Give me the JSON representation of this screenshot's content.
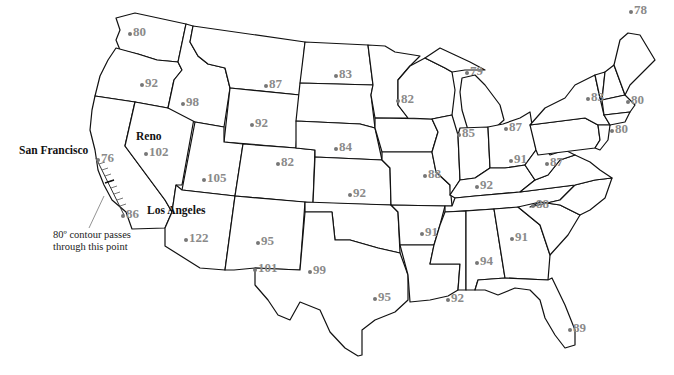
{
  "map": {
    "title": "",
    "units_hint": "temperature (°F)",
    "colors": {
      "state_fill": "#ffffff",
      "state_stroke": "#111111",
      "temperature_label": "#8a8a8a",
      "city_label": "#111111"
    }
  },
  "cities": [
    {
      "name": "San Francisco",
      "x": 19,
      "y": 145
    },
    {
      "name": "Reno",
      "x": 136,
      "y": 131
    },
    {
      "name": "Los Angeles",
      "x": 147,
      "y": 205
    }
  ],
  "annotation": {
    "line1": "80º contour passes",
    "line2": "through this point"
  },
  "temperatures": [
    {
      "value": "80",
      "x": 128,
      "y": 25,
      "region": "washington"
    },
    {
      "value": "92",
      "x": 140,
      "y": 76,
      "region": "oregon"
    },
    {
      "value": "98",
      "x": 181,
      "y": 95,
      "region": "idaho"
    },
    {
      "value": "87",
      "x": 264,
      "y": 77,
      "region": "montana"
    },
    {
      "value": "83",
      "x": 334,
      "y": 67,
      "region": "north-dakota"
    },
    {
      "value": "79",
      "x": 465,
      "y": 64,
      "region": "michigan-upper"
    },
    {
      "value": "78",
      "x": 629,
      "y": 3,
      "region": "maine"
    },
    {
      "value": "82",
      "x": 396,
      "y": 92,
      "region": "minnesota-wisconsin"
    },
    {
      "value": "83",
      "x": 586,
      "y": 90,
      "region": "new-york"
    },
    {
      "value": "80",
      "x": 626,
      "y": 93,
      "region": "massachusetts"
    },
    {
      "value": "92",
      "x": 250,
      "y": 116,
      "region": "wyoming"
    },
    {
      "value": "84",
      "x": 334,
      "y": 140,
      "region": "nebraska"
    },
    {
      "value": "85",
      "x": 457,
      "y": 126,
      "region": "illinois-chicago"
    },
    {
      "value": "87",
      "x": 504,
      "y": 120,
      "region": "michigan"
    },
    {
      "value": "76",
      "x": 96,
      "y": 151,
      "region": "san-francisco"
    },
    {
      "value": "102",
      "x": 144,
      "y": 145,
      "region": "nevada-reno"
    },
    {
      "value": "82",
      "x": 276,
      "y": 155,
      "region": "colorado"
    },
    {
      "value": "91",
      "x": 509,
      "y": 152,
      "region": "ohio"
    },
    {
      "value": "87",
      "x": 545,
      "y": 155,
      "region": "west-virginia"
    },
    {
      "value": "80",
      "x": 610,
      "y": 122,
      "region": "new-york-city"
    },
    {
      "value": "105",
      "x": 202,
      "y": 171,
      "region": "utah"
    },
    {
      "value": "88",
      "x": 423,
      "y": 167,
      "region": "missouri"
    },
    {
      "value": "92",
      "x": 348,
      "y": 186,
      "region": "kansas"
    },
    {
      "value": "92",
      "x": 475,
      "y": 178,
      "region": "kentucky"
    },
    {
      "value": "88",
      "x": 531,
      "y": 197,
      "region": "tennessee-nc"
    },
    {
      "value": "86",
      "x": 121,
      "y": 207,
      "region": "los-angeles"
    },
    {
      "value": "91",
      "x": 420,
      "y": 225,
      "region": "arkansas"
    },
    {
      "value": "91",
      "x": 510,
      "y": 230,
      "region": "georgia"
    },
    {
      "value": "122",
      "x": 184,
      "y": 231,
      "region": "arizona"
    },
    {
      "value": "95",
      "x": 256,
      "y": 234,
      "region": "new-mexico"
    },
    {
      "value": "94",
      "x": 475,
      "y": 254,
      "region": "alabama"
    },
    {
      "value": "101",
      "x": 253,
      "y": 261,
      "region": "el-paso"
    },
    {
      "value": "99",
      "x": 308,
      "y": 263,
      "region": "texas"
    },
    {
      "value": "95",
      "x": 373,
      "y": 290,
      "region": "houston"
    },
    {
      "value": "92",
      "x": 446,
      "y": 291,
      "region": "new-orleans"
    },
    {
      "value": "89",
      "x": 568,
      "y": 321,
      "region": "florida"
    }
  ]
}
